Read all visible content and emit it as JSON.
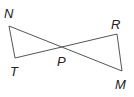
{
  "diagram": {
    "type": "geometry",
    "points": {
      "N": {
        "label": "N",
        "x": 9,
        "y": 26
      },
      "T": {
        "label": "T",
        "x": 15,
        "y": 58
      },
      "P": {
        "label": "P",
        "x": 64,
        "y": 48
      },
      "R": {
        "label": "R",
        "x": 117,
        "y": 34
      },
      "M": {
        "label": "M",
        "x": 122,
        "y": 71
      }
    },
    "segments": [
      [
        "N",
        "T"
      ],
      [
        "N",
        "M"
      ],
      [
        "T",
        "R"
      ],
      [
        "R",
        "M"
      ]
    ],
    "line_color": "#555555"
  }
}
